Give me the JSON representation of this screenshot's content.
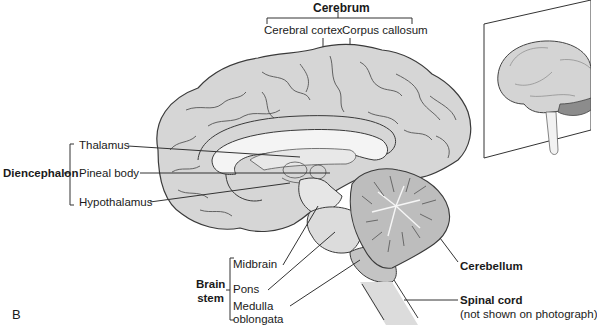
{
  "figure": {
    "panel_label": "B",
    "colors": {
      "cerebrum_fill": "#d6d6d6",
      "outline": "#3a3a3a",
      "white_matter": "#f4f4f4",
      "brainstem_fill": "#dcdcdc",
      "medulla_fill": "#c4c4c4",
      "cerebellum_fill": "#bdbdbd",
      "leader_line": "#333333"
    }
  },
  "labels": {
    "cerebrum": {
      "group": "Cerebrum",
      "cortex": "Cerebral cortex",
      "callosum": "Corpus callosum"
    },
    "diencephalon": {
      "group": "Diencephalon",
      "thalamus": "Thalamus",
      "pineal": "Pineal body",
      "hypothalamus": "Hypothalamus"
    },
    "brainstem": {
      "group_line1": "Brain",
      "group_line2": "stem",
      "midbrain": "Midbrain",
      "pons": "Pons",
      "medulla_line1": "Medulla",
      "medulla_line2": "oblongata"
    },
    "cerebellum": "Cerebellum",
    "spinal_cord": {
      "title": "Spinal cord",
      "note": "(not shown on photograph)"
    }
  },
  "inset": {
    "description": "Lateral view of whole brain with sagittal plane",
    "icon": "brain-photo-inset"
  }
}
